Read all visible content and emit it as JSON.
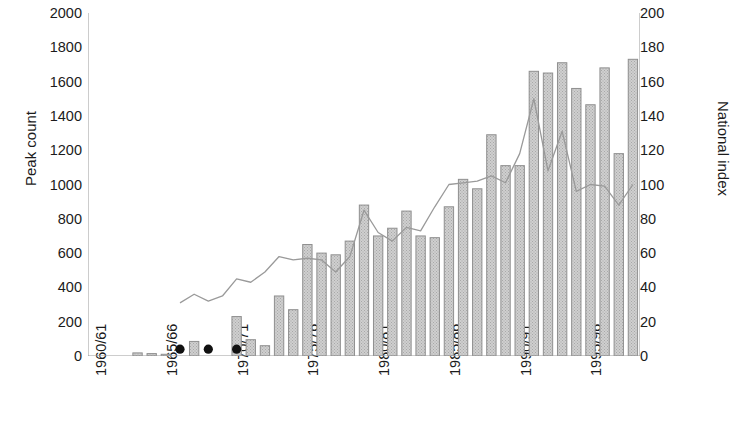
{
  "chart_data": {
    "type": "bar",
    "title": "",
    "xlabel": "",
    "ylabel": "Peak count",
    "y2label": "National index",
    "ylim": [
      0,
      2000
    ],
    "y2lim": [
      0,
      200
    ],
    "ytick_labels": [
      "2000",
      "1800",
      "1600",
      "1400",
      "1200",
      "1000",
      "800",
      "600",
      "400",
      "200",
      "0"
    ],
    "ytick_values": [
      2000,
      1800,
      1600,
      1400,
      1200,
      1000,
      800,
      600,
      400,
      200,
      0
    ],
    "y2tick_labels": [
      "200",
      "180",
      "160",
      "140",
      "120",
      "100",
      "80",
      "60",
      "40",
      "20",
      "0"
    ],
    "y2tick_values": [
      200,
      180,
      160,
      140,
      120,
      100,
      80,
      60,
      40,
      20,
      0
    ],
    "grid": false,
    "legend": "none",
    "categories": [
      "1960/61",
      "1961/62",
      "1962/63",
      "1963/64",
      "1964/65",
      "1965/66",
      "1966/67",
      "1967/68",
      "1968/69",
      "1969/70",
      "1970/71",
      "1971/72",
      "1972/73",
      "1973/74",
      "1974/75",
      "1975/76",
      "1976/77",
      "1977/78",
      "1978/79",
      "1979/80",
      "1980/81",
      "1981/82",
      "1982/83",
      "1983/84",
      "1984/85",
      "1985/86",
      "1986/87",
      "1987/88",
      "1988/89",
      "1989/90",
      "1990/91",
      "1991/92",
      "1992/93",
      "1993/94",
      "1994/95",
      "1995/96",
      "1996/97",
      "1997/98",
      "1998/99"
    ],
    "xtick_labels": [
      "1960/61",
      "1965/66",
      "1970/71",
      "1975/76",
      "1980/81",
      "1985/86",
      "1990/91",
      "1995/96"
    ],
    "xtick_indices": [
      0,
      5,
      10,
      15,
      20,
      25,
      30,
      35
    ],
    "series": [
      {
        "name": "Peak count",
        "type": "bar",
        "axis": "left",
        "values": [
          0,
          0,
          0,
          18,
          14,
          10,
          0,
          85,
          0,
          0,
          230,
          95,
          60,
          350,
          270,
          650,
          600,
          590,
          670,
          880,
          700,
          745,
          845,
          700,
          690,
          870,
          1030,
          975,
          1290,
          1110,
          1110,
          1660,
          1650,
          1710,
          1560,
          1465,
          1680,
          1180,
          1730
        ]
      },
      {
        "name": "National index",
        "type": "line",
        "axis": "right",
        "values": [
          null,
          null,
          null,
          null,
          null,
          null,
          31,
          36,
          32,
          35,
          45,
          43,
          49,
          58,
          56,
          57,
          56,
          49,
          58,
          85,
          72,
          67,
          75,
          73,
          87,
          100,
          101,
          102,
          105,
          101,
          118,
          150,
          108,
          131,
          96,
          100,
          99,
          88,
          100
        ]
      }
    ],
    "point_markers": {
      "name": "black dots",
      "axis": "left",
      "value": 40,
      "category_indices": [
        6,
        8,
        10
      ]
    },
    "colors": {
      "bar_fill": "#c2c2c2",
      "bar_edge": "#8f8f8f",
      "line": "#9a9a9a",
      "marker": "#111111",
      "axis": "#9a9a9a",
      "text": "#1b1b1b",
      "background": "#ffffff"
    }
  }
}
